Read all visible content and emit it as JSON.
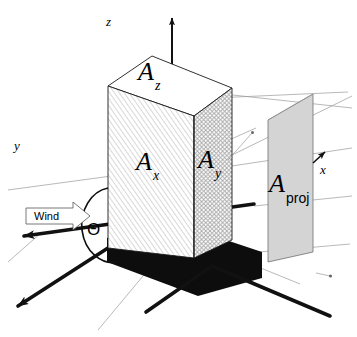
{
  "figure": {
    "type": "isometric-technical-diagram"
  },
  "axes": [
    {
      "id": "z",
      "label": "z",
      "direction": "up",
      "arrow": true
    },
    {
      "id": "y",
      "label": "y",
      "direction": "upper-left",
      "arrow": true
    },
    {
      "id": "x",
      "label": "x",
      "direction": "upper-right",
      "arrow": true
    }
  ],
  "areas": [
    {
      "id": "A_z",
      "base": "A",
      "sub": "z",
      "face": "top",
      "fill": "white",
      "pattern": "none"
    },
    {
      "id": "A_x",
      "base": "A",
      "sub": "x",
      "face": "left",
      "fill": "white",
      "pattern": "diagonal-hatch"
    },
    {
      "id": "A_y",
      "base": "A",
      "sub": "y",
      "face": "right",
      "fill": "white",
      "pattern": "cross-hatch"
    },
    {
      "id": "A_proj",
      "base": "A",
      "sub": "proj",
      "face": "projection",
      "fill": "#d4d4d4",
      "pattern": "solid"
    }
  ],
  "annotations": {
    "wind_label": "Wind",
    "angle_label": "Θ"
  },
  "colors": {
    "ink": "#111111",
    "thin_line": "#9a9a9a",
    "shadow": "#0d0d0d",
    "projection_fill": "#d4d4d4"
  }
}
